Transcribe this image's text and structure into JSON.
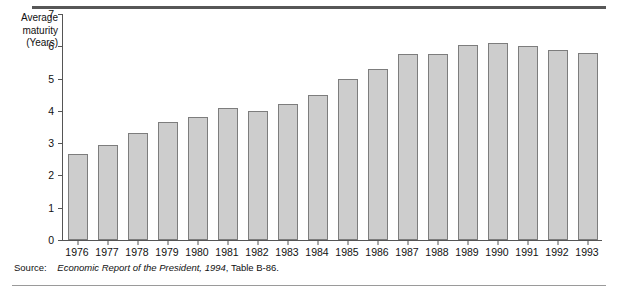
{
  "figure": {
    "axis_title_lines": [
      "Average",
      "maturity",
      "(Years)"
    ],
    "source_label": "Source:",
    "source_italic": "Economic Report of the President, 1994",
    "source_tail": ", Table B-86."
  },
  "colors": {
    "bar_fill": "#cdcdcd",
    "bar_border": "#7d7d7d",
    "axis": "#555555",
    "rule_top": "#575757",
    "rule_bottom": "#9a9a9a",
    "text": "#111111"
  },
  "chart_data": {
    "type": "bar",
    "title": "",
    "xlabel": "",
    "ylabel": "Average maturity (Years)",
    "ylim": [
      0,
      7
    ],
    "yticks": [
      0,
      1,
      2,
      3,
      4,
      5,
      6,
      7
    ],
    "grid": false,
    "legend": "none",
    "categories": [
      "1976",
      "1977",
      "1978",
      "1979",
      "1980",
      "1981",
      "1982",
      "1983",
      "1984",
      "1985",
      "1986",
      "1987",
      "1988",
      "1989",
      "1990",
      "1991",
      "1992",
      "1993"
    ],
    "values": [
      2.65,
      2.95,
      3.3,
      3.65,
      3.8,
      4.1,
      4.0,
      4.2,
      4.5,
      5.0,
      5.3,
      5.75,
      5.75,
      6.05,
      6.1,
      6.0,
      5.9,
      5.8
    ]
  }
}
